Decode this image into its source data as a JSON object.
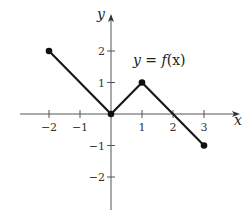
{
  "chart_data": {
    "type": "line",
    "title": "",
    "annotation": "y = f(x)",
    "xlabel": "x",
    "ylabel": "y",
    "x": [
      -2,
      0,
      1,
      3
    ],
    "series": [
      {
        "name": "y = f(x)",
        "points": [
          [
            -2,
            2
          ],
          [
            0,
            0
          ],
          [
            1,
            1
          ],
          [
            3,
            -1
          ]
        ],
        "endpoints_marked": true
      }
    ],
    "xlim": [
      -2.9,
      4.2
    ],
    "ylim": [
      -3,
      3
    ],
    "x_ticks": [
      -2,
      -1,
      1,
      2,
      3
    ],
    "y_ticks": [
      -2,
      -1,
      1,
      2
    ],
    "x_tick_labels": [
      "−2",
      "−1",
      "1",
      "2",
      "3"
    ],
    "y_tick_labels": [
      "−2",
      "−1",
      "1",
      "2"
    ],
    "grid": false,
    "legend": null,
    "colors": {
      "line": "#1a1a1a",
      "axis": "#555555",
      "marker": "#111111"
    }
  },
  "labels": {
    "x_axis": "x",
    "y_axis": "y",
    "function_prefix": "y = ",
    "function_f": "f",
    "function_args": "(x)"
  }
}
